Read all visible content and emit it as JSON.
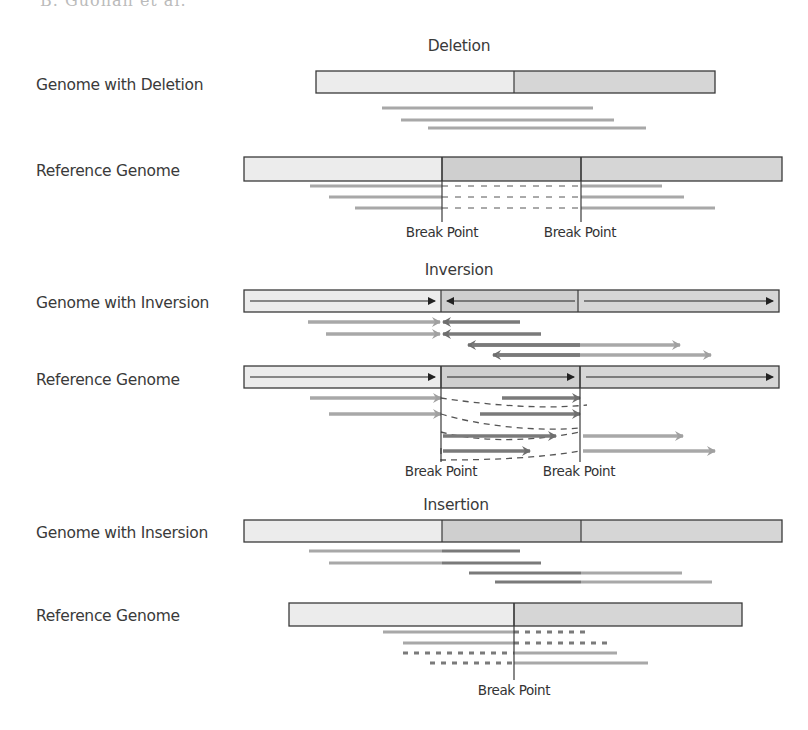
{
  "caption": "Genomic structural variation schematics",
  "top_caption_fragment": "B. Guohan et al.",
  "colors": {
    "light_segment": "#ececec",
    "mid_segment": "#d6d6d6",
    "dark_segment": "#cfcfcf",
    "border": "#3a3a3a",
    "read_light": "#a8a8a8",
    "read_dark": "#7a7a7a",
    "arrow_inner": "#222222",
    "dash": "#555555",
    "text": "#3a3a3a"
  },
  "sections": {
    "deletion": {
      "title": "Deletion",
      "title_x": 459,
      "title_y": 45,
      "sample_label": "Genome with Deletion",
      "sample_label_y": 77,
      "reference_label": "Reference Genome",
      "reference_label_y": 163,
      "sample_bar": {
        "x1": 316,
        "x2": 715,
        "y": 71,
        "h": 22,
        "segments": [
          {
            "x1": 316,
            "x2": 514,
            "shade": "light"
          },
          {
            "x1": 514,
            "x2": 715,
            "shade": "mid"
          }
        ]
      },
      "sample_reads": [
        {
          "x1": 382,
          "x2": 593,
          "y": 108
        },
        {
          "x1": 401,
          "x2": 614,
          "y": 120
        },
        {
          "x1": 428,
          "x2": 646,
          "y": 128
        }
      ],
      "reference_bar": {
        "x1": 244,
        "x2": 782,
        "y": 157,
        "h": 24,
        "segments": [
          {
            "x1": 244,
            "x2": 442,
            "shade": "light"
          },
          {
            "x1": 442,
            "x2": 581,
            "shade": "dark"
          },
          {
            "x1": 581,
            "x2": 782,
            "shade": "mid"
          }
        ]
      },
      "reference_reads": [
        {
          "left": [
            310,
            442
          ],
          "dash": [
            442,
            581
          ],
          "right": [
            581,
            662
          ],
          "y": 186
        },
        {
          "left": [
            329,
            442
          ],
          "dash": [
            442,
            581
          ],
          "right": [
            581,
            684
          ],
          "y": 197
        },
        {
          "left": [
            355,
            442
          ],
          "dash": [
            442,
            581
          ],
          "right": [
            581,
            715
          ],
          "y": 208
        }
      ],
      "break_points": [
        {
          "x": 442,
          "label": "Break Point"
        },
        {
          "x": 581,
          "label": "Break Point"
        }
      ],
      "break_line_bottom": 222,
      "break_label_y": 224
    },
    "inversion": {
      "title": "Inversion",
      "title_x": 459,
      "title_y": 262,
      "sample_label": "Genome with Inversion",
      "sample_label_y": 296,
      "reference_label": "Reference Genome",
      "reference_label_y": 372,
      "sample_bar": {
        "x1": 244,
        "x2": 779,
        "y": 290,
        "h": 22,
        "segments": [
          {
            "x1": 244,
            "x2": 441,
            "shade": "light"
          },
          {
            "x1": 441,
            "x2": 578,
            "shade": "dark"
          },
          {
            "x1": 578,
            "x2": 779,
            "shade": "mid"
          }
        ],
        "inner_arrows": [
          {
            "x1": 250,
            "x2": 435,
            "dir": "right"
          },
          {
            "x1": 447,
            "x2": 575,
            "dir": "left"
          },
          {
            "x1": 584,
            "x2": 773,
            "dir": "right"
          }
        ]
      },
      "sample_reads": [
        {
          "light": [
            308,
            440
          ],
          "dark": [
            443,
            520
          ],
          "y": 322,
          "type": "converge"
        },
        {
          "light": [
            326,
            440
          ],
          "dark": [
            443,
            541
          ],
          "y": 334,
          "type": "converge"
        },
        {
          "dark": [
            468,
            580
          ],
          "light": [
            580,
            680
          ],
          "y": 345,
          "type": "diverge"
        },
        {
          "dark": [
            493,
            580
          ],
          "light": [
            580,
            711
          ],
          "y": 355,
          "type": "diverge"
        }
      ],
      "reference_bar": {
        "x1": 244,
        "x2": 779,
        "y": 366,
        "h": 22,
        "segments": [
          {
            "x1": 244,
            "x2": 441,
            "shade": "light"
          },
          {
            "x1": 441,
            "x2": 580,
            "shade": "dark"
          },
          {
            "x1": 580,
            "x2": 779,
            "shade": "mid"
          }
        ],
        "inner_arrows": [
          {
            "x1": 250,
            "x2": 435,
            "dir": "right"
          },
          {
            "x1": 447,
            "x2": 574,
            "dir": "right"
          },
          {
            "x1": 586,
            "x2": 773,
            "dir": "right"
          }
        ]
      },
      "reference_reads": [
        {
          "x1": 310,
          "x2": 441,
          "y": 398,
          "shade": "light"
        },
        {
          "x1": 502,
          "x2": 580,
          "y": 398,
          "shade": "dark"
        },
        {
          "x1": 329,
          "x2": 441,
          "y": 414,
          "shade": "light"
        },
        {
          "x1": 480,
          "x2": 580,
          "y": 414,
          "shade": "dark"
        },
        {
          "x1": 443,
          "x2": 556,
          "y": 436,
          "shade": "dark"
        },
        {
          "x1": 583,
          "x2": 683,
          "y": 436,
          "shade": "light"
        },
        {
          "x1": 443,
          "x2": 530,
          "y": 451,
          "shade": "dark"
        },
        {
          "x1": 583,
          "x2": 715,
          "y": 451,
          "shade": "light"
        }
      ],
      "dashed_links": [
        "M441,398 C480,404 540,410 587,405",
        "M441,414 C480,426 540,432 580,428",
        "M441,432 C470,440 520,444 580,432",
        "M441,448 L441,460 C490,460 540,458 580,451"
      ],
      "break_points": [
        {
          "x": 441,
          "label": "Break Point"
        },
        {
          "x": 580,
          "label": "Break Point"
        }
      ],
      "break_line_bottom": 462,
      "break_label_y": 463
    },
    "insertion": {
      "title": "Insertion",
      "title_x": 456,
      "title_y": 497,
      "sample_label": "Genome with Insersion",
      "sample_label_y": 527,
      "reference_label": "Reference Genome",
      "reference_label_y": 609,
      "sample_bar": {
        "x1": 244,
        "x2": 782,
        "y": 520,
        "h": 22,
        "segments": [
          {
            "x1": 244,
            "x2": 442,
            "shade": "light"
          },
          {
            "x1": 442,
            "x2": 581,
            "shade": "dark"
          },
          {
            "x1": 581,
            "x2": 782,
            "shade": "mid"
          }
        ]
      },
      "sample_reads": [
        {
          "light": [
            309,
            442
          ],
          "dark": [
            442,
            520
          ],
          "y": 551
        },
        {
          "light": [
            329,
            442
          ],
          "dark": [
            442,
            541
          ],
          "y": 563
        },
        {
          "dark": [
            469,
            581
          ],
          "light": [
            581,
            682
          ],
          "y": 573
        },
        {
          "dark": [
            495,
            581
          ],
          "light": [
            581,
            712
          ],
          "y": 582
        }
      ],
      "reference_bar": {
        "x1": 289,
        "x2": 742,
        "y": 603,
        "h": 23,
        "segments": [
          {
            "x1": 289,
            "x2": 514,
            "shade": "light"
          },
          {
            "x1": 514,
            "x2": 742,
            "shade": "mid"
          }
        ]
      },
      "reference_reads": [
        {
          "solid": [
            383,
            514
          ],
          "dashed": [
            514,
            590
          ],
          "y": 632
        },
        {
          "solid": [
            403,
            514
          ],
          "dashed": [
            514,
            612
          ],
          "y": 643
        },
        {
          "dashed": [
            403,
            514
          ],
          "solid": [
            514,
            617
          ],
          "y": 653
        },
        {
          "dashed": [
            430,
            514
          ],
          "solid": [
            514,
            648
          ],
          "y": 663
        }
      ],
      "break_points": [
        {
          "x": 514,
          "label": "Break Point"
        }
      ],
      "break_line_bottom": 680,
      "break_label_y": 682
    }
  }
}
